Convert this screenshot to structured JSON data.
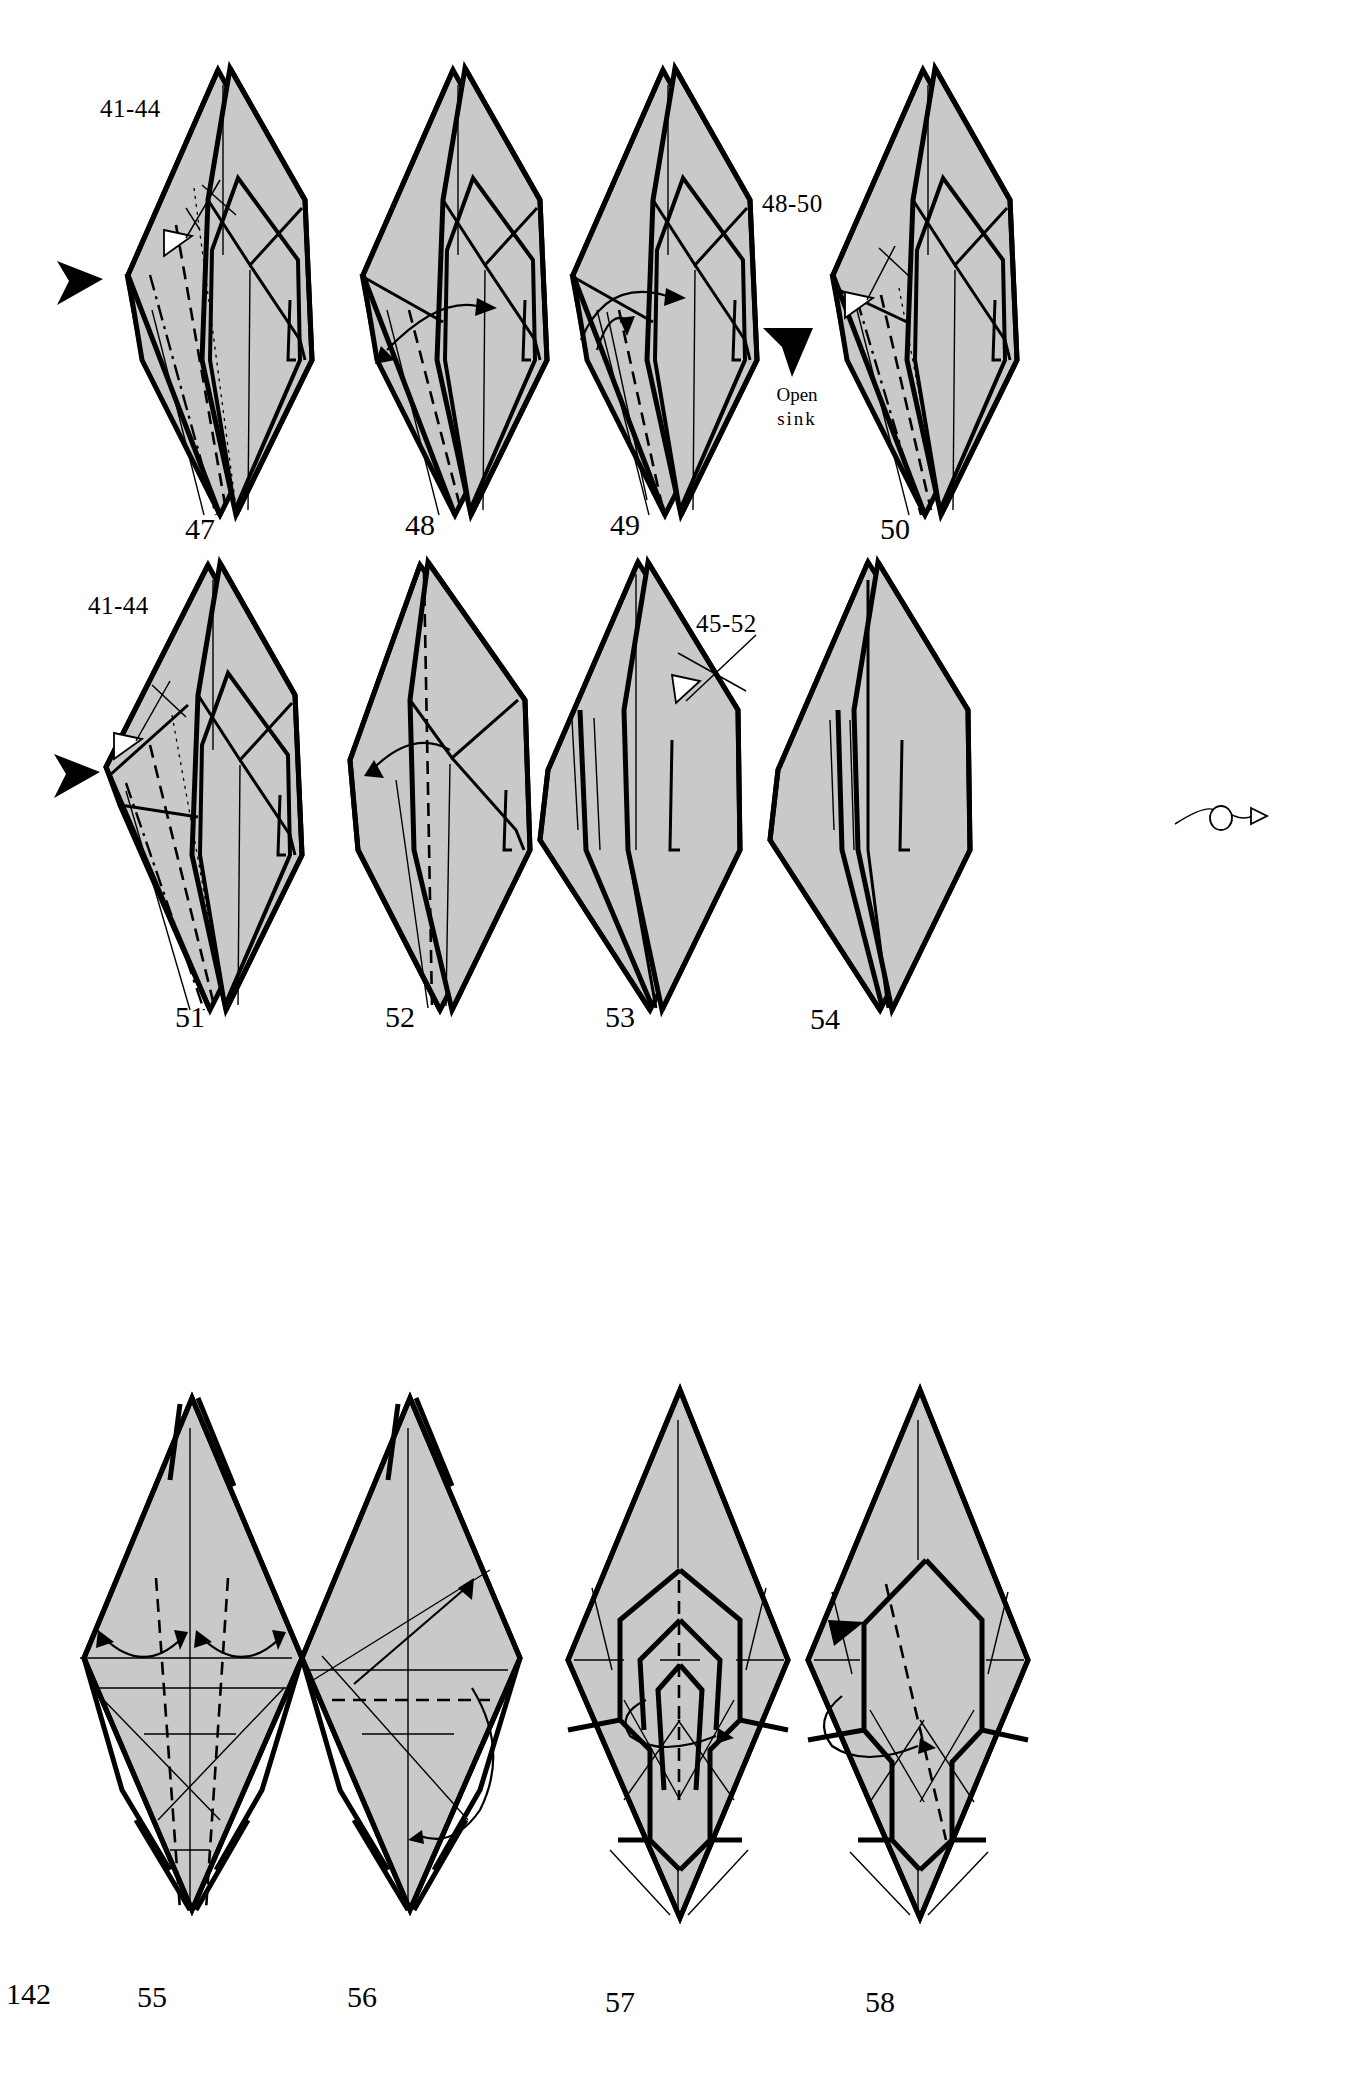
{
  "page": {
    "number": "142",
    "kind": "origami-diagram-page",
    "paper_fill": "#c9c9c9",
    "ink": "#000000",
    "background": "#ffffff",
    "rows": 3,
    "columns": 4
  },
  "steps": [
    {
      "number": "47",
      "row": 1,
      "column": 1,
      "reference_label": "41-44",
      "markers": [
        "black-solid-triangle-pointer",
        "hollow-arrowhead-pointer"
      ],
      "creases": [
        "mountain",
        "valley",
        "dotted"
      ]
    },
    {
      "number": "48",
      "row": 1,
      "column": 2,
      "reference_label": "",
      "markers": [
        "curved-fold-arrow"
      ],
      "creases": [
        "valley"
      ]
    },
    {
      "number": "49",
      "row": 1,
      "column": 3,
      "reference_label": "",
      "markers": [
        "curved-fold-arrow",
        "double-curved-fold-arrow"
      ],
      "creases": [
        "valley"
      ]
    },
    {
      "number": "50",
      "row": 1,
      "column": 4,
      "reference_label": "48-50",
      "procedure_label_line1": "Open",
      "procedure_label_line2": "sink",
      "markers": [
        "black-solid-triangle-pointer",
        "hollow-arrowhead-pointer"
      ],
      "creases": [
        "mountain",
        "valley",
        "dotted"
      ]
    },
    {
      "number": "51",
      "row": 2,
      "column": 1,
      "reference_label": "41-44",
      "markers": [
        "black-solid-triangle-pointer",
        "hollow-arrowhead-pointer"
      ],
      "creases": [
        "mountain",
        "valley",
        "dotted"
      ]
    },
    {
      "number": "52",
      "row": 2,
      "column": 2,
      "reference_label": "",
      "markers": [
        "curved-fold-arrow"
      ],
      "creases": [
        "valley"
      ]
    },
    {
      "number": "53",
      "row": 2,
      "column": 3,
      "reference_label": "45-52",
      "markers": [
        "hollow-arrowhead-pointer"
      ],
      "creases": []
    },
    {
      "number": "54",
      "row": 2,
      "column": 4,
      "reference_label": "",
      "markers": [
        "turn-over-symbol"
      ],
      "creases": []
    },
    {
      "number": "55",
      "row": 3,
      "column": 1,
      "reference_label": "",
      "markers": [
        "curved-fold-arrow",
        "curved-fold-arrow"
      ],
      "creases": [
        "valley",
        "crease"
      ]
    },
    {
      "number": "56",
      "row": 3,
      "column": 2,
      "reference_label": "",
      "markers": [
        "curved-fold-arrow",
        "wrap-around-arrow"
      ],
      "creases": [
        "valley",
        "crease"
      ]
    },
    {
      "number": "57",
      "row": 3,
      "column": 3,
      "reference_label": "",
      "markers": [
        "rotate-arrow"
      ],
      "creases": [
        "valley"
      ]
    },
    {
      "number": "58",
      "row": 3,
      "column": 4,
      "reference_label": "",
      "markers": [
        "black-solid-triangle-pointer",
        "rotate-arrow"
      ],
      "creases": [
        "valley"
      ]
    }
  ]
}
